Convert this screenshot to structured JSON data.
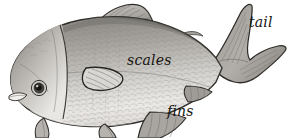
{
  "figure": {
    "style": "grayscale pencil illustration",
    "background_color": "#ffffff",
    "width": 289,
    "height": 138,
    "labels": [
      {
        "id": "tail",
        "text": "tail",
        "x": 249,
        "y": 15,
        "font_size": 14,
        "italic": true,
        "color": "#15140f"
      },
      {
        "id": "scales",
        "text": "scales",
        "x": 127,
        "y": 53,
        "font_size": 14,
        "italic": true,
        "color": "#15140f"
      },
      {
        "id": "fins",
        "text": "fins",
        "x": 167,
        "y": 104,
        "font_size": 14,
        "italic": true,
        "color": "#15140f"
      }
    ],
    "parts": [
      {
        "name": "head",
        "label": "head"
      },
      {
        "name": "eye",
        "label": "eye"
      },
      {
        "name": "mouth",
        "label": "mouth"
      },
      {
        "name": "gill-cover",
        "label": "gill cover"
      },
      {
        "name": "body",
        "label": "body"
      },
      {
        "name": "dorsal-fin",
        "label": "dorsal fin"
      },
      {
        "name": "pectoral-fin",
        "label": "pectoral fin"
      },
      {
        "name": "pelvic-fin",
        "label": "pelvic fin"
      },
      {
        "name": "anal-fin",
        "label": "anal fin"
      },
      {
        "name": "caudal-fin",
        "label": "tail fin"
      },
      {
        "name": "scale-texture",
        "label": "scales"
      }
    ],
    "palette": {
      "outline": "#2f2d29",
      "body_dark": "#8d8a85",
      "body_mid": "#b4b1ac",
      "body_light": "#e6e4e0",
      "belly": "#f1efec",
      "fin_fill": "#a7a4a0",
      "fin_dark": "#7e7b77",
      "eye_dark": "#1c1b18",
      "label_color": "#15140f"
    }
  }
}
